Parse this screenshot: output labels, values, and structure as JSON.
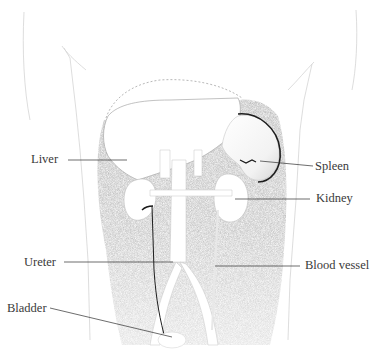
{
  "diagram": {
    "type": "anatomical-illustration",
    "colors": {
      "background": "#ffffff",
      "shading": "#8e8e8e",
      "outline": "#9a9a9a",
      "label_text": "#3a3a3a",
      "leader_line": "#2e2e2e",
      "ureter_line": "#1e1e1e"
    },
    "labels": [
      {
        "id": "liver",
        "text": "Liver",
        "x": 31,
        "y": 158
      },
      {
        "id": "spleen",
        "text": "Spleen",
        "x": 315,
        "y": 160
      },
      {
        "id": "kidney",
        "text": "Kidney",
        "x": 316,
        "y": 191
      },
      {
        "id": "ureter",
        "text": "Ureter",
        "x": 24,
        "y": 257
      },
      {
        "id": "blood-vessel",
        "text": "Blood vessel",
        "x": 305,
        "y": 259
      },
      {
        "id": "bladder",
        "text": "Bladder",
        "x": 7,
        "y": 304
      }
    ]
  }
}
